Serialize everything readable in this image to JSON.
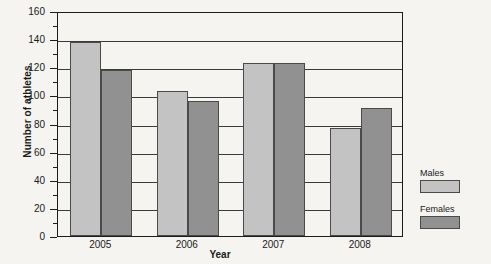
{
  "chart_data": {
    "type": "bar",
    "title": "",
    "xlabel": "Year",
    "ylabel": "Number of athletes",
    "categories": [
      "2005",
      "2006",
      "2007",
      "2008"
    ],
    "series": [
      {
        "name": "Males",
        "color": "#c3c3c3",
        "values": [
          138,
          103,
          123,
          77
        ]
      },
      {
        "name": "Females",
        "color": "#919191",
        "values": [
          118,
          96,
          123,
          91
        ]
      }
    ],
    "ylim": [
      0,
      160
    ],
    "ytick_step": 20,
    "yticks": [
      0,
      20,
      40,
      60,
      80,
      100,
      120,
      140,
      160
    ],
    "ytick_labels": [
      "0",
      "20",
      "40",
      "60",
      "80",
      "100",
      "120",
      "140",
      "160"
    ],
    "minor_tick_step": 10,
    "grid": "horizontal",
    "legend_position": "right"
  },
  "legend": {
    "males_label": "Males",
    "females_label": "Females"
  },
  "axes": {
    "y_title": "Number of athletes",
    "x_title": "Year"
  }
}
